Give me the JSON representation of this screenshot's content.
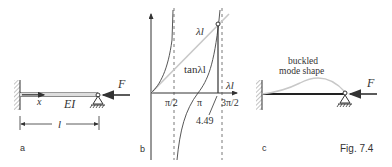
{
  "figure": {
    "caption": "Fig. 7.4",
    "panels": {
      "a": {
        "label": "a",
        "beam_label": "EI",
        "axis_label": "x",
        "length_label": "l",
        "force_label": "F"
      },
      "b": {
        "label": "b",
        "x_axis_label": "λl",
        "curve_labels": [
          "λl",
          "tanλl"
        ],
        "ticks": [
          "π/2",
          "π",
          "3π/2"
        ],
        "root_label": "4.49"
      },
      "c": {
        "label": "c",
        "mode_label_line1": "buckled",
        "mode_label_line2": "mode shape",
        "force_label": "F"
      }
    }
  },
  "colors": {
    "ink": "#333333",
    "light_curve": "#c8c8c8",
    "hatch": "#888888"
  }
}
